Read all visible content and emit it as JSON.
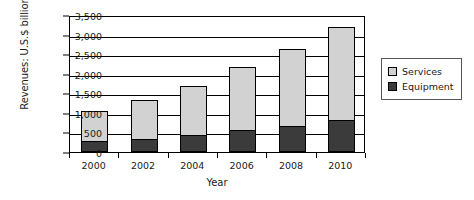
{
  "chart_data": {
    "type": "bar",
    "subtype": "stacked-bar",
    "title": "",
    "xlabel": "Year",
    "ylabel": "Revenues: U.S.$ billion",
    "categories": [
      "2000",
      "2002",
      "2004",
      "2006",
      "2008",
      "2010"
    ],
    "series": [
      {
        "name": "Equipment",
        "color": "#3b3b3b",
        "values": [
          290,
          340,
          450,
          570,
          680,
          820
        ]
      },
      {
        "name": "Services",
        "color": "#d2d2d2",
        "values": [
          800,
          1010,
          1280,
          1620,
          1990,
          2400
        ]
      }
    ],
    "totals": [
      1090,
      1350,
      1730,
      2190,
      2670,
      3220
    ],
    "ylim": [
      0,
      3500
    ],
    "ytick_values": [
      0,
      500,
      1000,
      1500,
      2000,
      2500,
      3000,
      3500
    ],
    "ytick_labels": [
      "0",
      "500",
      "1,000",
      "1,500",
      "2,000",
      "2,500",
      "3,000",
      "3,500"
    ],
    "grid": true,
    "grid_axis": "y",
    "legend_position": "right",
    "legend_entries": [
      "Services",
      "Equipment"
    ],
    "stack_order_bottom_to_top": [
      "Equipment",
      "Services"
    ],
    "background_color": "#ffffff",
    "axis_color": "#000000"
  }
}
